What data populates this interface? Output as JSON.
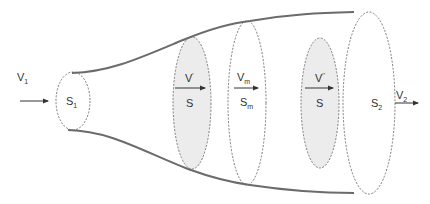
{
  "diagram": {
    "colors": {
      "wall": "#6b6b6b",
      "section_outline": "#7a7a7a",
      "section_fill_shaded": "#ececec",
      "arrow": "#333333",
      "text": "#333333"
    },
    "sections": [
      {
        "id": "s1",
        "label_main": "S",
        "label_sub": "1",
        "shaded": false
      },
      {
        "id": "s_prime",
        "label_main": "S",
        "label_sub": "",
        "shaded": true
      },
      {
        "id": "sm",
        "label_main": "S",
        "label_sub": "m",
        "shaded": false
      },
      {
        "id": "s_doubleprime",
        "label_main": "S",
        "label_sub": "",
        "shaded": true
      },
      {
        "id": "s2",
        "label_main": "S",
        "label_sub": "2",
        "shaded": false
      }
    ],
    "velocities": [
      {
        "id": "v1",
        "label_main": "V",
        "label_sub": "1",
        "label_sup": ""
      },
      {
        "id": "v_prime",
        "label_main": "V",
        "label_sub": "",
        "label_sup": "'"
      },
      {
        "id": "vm",
        "label_main": "V",
        "label_sub": "m",
        "label_sup": ""
      },
      {
        "id": "v_doubleprime",
        "label_main": "V",
        "label_sub": "",
        "label_sup": "''"
      },
      {
        "id": "v2",
        "label_main": "V",
        "label_sub": "2",
        "label_sup": ""
      }
    ]
  }
}
